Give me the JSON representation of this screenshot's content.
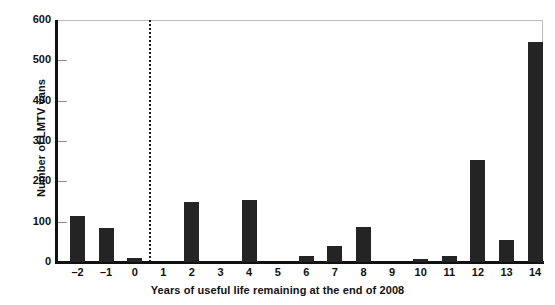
{
  "chart_data": {
    "type": "bar",
    "title": "",
    "xlabel": "Years of useful life remaining at the end of 2008",
    "ylabel": "Number of LMTV vans",
    "categories": [
      "–2",
      "–1",
      "0",
      "1",
      "2",
      "3",
      "4",
      "5",
      "6",
      "7",
      "8",
      "9",
      "10",
      "11",
      "12",
      "13",
      "14"
    ],
    "values": [
      113,
      84,
      10,
      0,
      149,
      0,
      154,
      0,
      15,
      40,
      87,
      0,
      7,
      14,
      253,
      55,
      545
    ],
    "ylim": [
      0,
      600
    ],
    "yticks": [
      0,
      100,
      200,
      300,
      400,
      500,
      600
    ],
    "ytick_labels": [
      "0",
      "100",
      "200",
      "300",
      "400",
      "500",
      "600"
    ],
    "grid": false,
    "legend": "none",
    "bar_color": "#242424",
    "annotations": [
      {
        "name": "vertical-dashed-divider",
        "style": "dotted",
        "color": "#1a1a1a",
        "between_categories": [
          "0",
          "1"
        ]
      }
    ]
  }
}
